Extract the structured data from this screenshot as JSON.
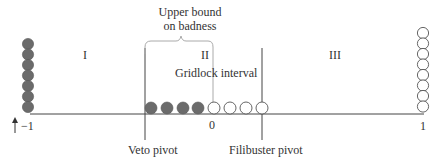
{
  "diagram": {
    "regions": [
      {
        "id": "I",
        "label": "I"
      },
      {
        "id": "II",
        "label": "II"
      },
      {
        "id": "III",
        "label": "III"
      }
    ],
    "brace_label_line1": "Upper bound",
    "brace_label_line2": "on badness",
    "gridlock_label": "Gridlock interval",
    "axis_ticks": {
      "left": "−1",
      "zero": "0",
      "right": "1"
    },
    "pivots": {
      "veto": "Veto pivot",
      "filibuster": "Filibuster pivot"
    },
    "stacks": {
      "left_filled_count": 7,
      "right_open_count": 8,
      "axis_filled_count": 4,
      "axis_open_count": 4
    },
    "arrow_icon": "up-arrow",
    "colors": {
      "filled_circle": "#6b6b6b",
      "open_circle_stroke": "#555555",
      "line": "#444444",
      "brace": "#aaaaaa"
    }
  }
}
